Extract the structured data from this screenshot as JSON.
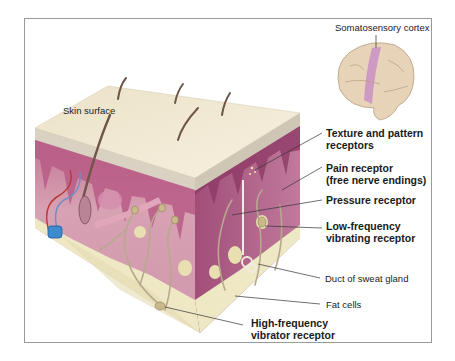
{
  "diagram": {
    "type": "anatomical-illustration",
    "colors": {
      "epidermis_top": "#efe6cf",
      "dermis": "#c98aa3",
      "dermis_dark": "#a4527a",
      "fat": "#eee8c4",
      "cortex_highlight": "#c98fc4",
      "brain": "#e6d3b8",
      "blood_vessel_blue": "#3f8bd0",
      "blood_vessel_red": "#b83a32",
      "leader_line": "#333333"
    },
    "labels": {
      "somatosensory_cortex": "Somatosensory cortex",
      "skin_surface": "Skin surface",
      "texture_line1": "Texture and pattern",
      "texture_line2": "receptors",
      "pain_line1": "Pain receptor",
      "pain_line2": "(free nerve endings)",
      "pressure": "Pressure receptor",
      "lowfreq_line1": "Low-frequency",
      "lowfreq_line2": "vibrating receptor",
      "sweat_duct": "Duct of sweat gland",
      "fat_cells": "Fat cells",
      "highfreq_line1": "High-frequency",
      "highfreq_line2": "vibrator receptor"
    }
  }
}
